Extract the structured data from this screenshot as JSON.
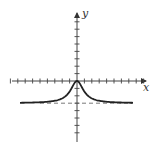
{
  "diagram": {
    "type": "function-graph",
    "axes": {
      "x_label": "x",
      "y_label": "y",
      "x_ticks": [
        -9,
        -8,
        -7,
        -6,
        -5,
        -4,
        -3,
        -2,
        -1,
        1,
        2,
        3,
        4,
        5,
        6,
        7,
        8,
        9
      ],
      "y_ticks": [
        -8,
        -7,
        -6,
        -5,
        -4,
        -3,
        -2,
        -1,
        1,
        2,
        3,
        4,
        5,
        6,
        7,
        8,
        9
      ]
    },
    "curve": {
      "description": "Peak with cusp at origin, decaying to horizontal asymptote",
      "peak": [
        0,
        0
      ],
      "asymptote_y": -3,
      "color": "#222222"
    },
    "asymptote": {
      "y": -3,
      "style": "dashed",
      "color": "#555555"
    }
  }
}
